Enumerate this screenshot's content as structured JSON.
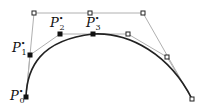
{
  "diagram": {
    "type": "bezier-subdivision",
    "colors": {
      "curve": "#222222",
      "polygon": "#b0b0b0",
      "point_fill": "#111111",
      "point_hollow_stroke": "#222222",
      "background": "#ffffff"
    },
    "outer_polygon": [
      [
        26,
        97
      ],
      [
        34,
        13
      ],
      [
        90,
        13
      ],
      [
        143,
        13
      ],
      [
        192,
        99
      ]
    ],
    "inner_polygon": [
      [
        26,
        97
      ],
      [
        30,
        55
      ],
      [
        60,
        34
      ],
      [
        93,
        34
      ],
      [
        128,
        34
      ],
      [
        167,
        57
      ],
      [
        192,
        99
      ]
    ],
    "hollow_points": [
      [
        34,
        13
      ],
      [
        90,
        13
      ],
      [
        143,
        13
      ],
      [
        128,
        34
      ],
      [
        167,
        57
      ],
      [
        192,
        99
      ]
    ],
    "filled_points": [
      [
        26,
        97
      ],
      [
        30,
        55
      ],
      [
        60,
        34
      ],
      [
        93,
        34
      ]
    ],
    "curve_path": "M26,97 C27,68 40,40 93,34 C130,32 170,55 192,99",
    "labels": [
      {
        "id": "p0",
        "base": "P",
        "sub": "0",
        "sup": "•",
        "x": 10,
        "y": 100
      },
      {
        "id": "p1",
        "base": "P",
        "sub": "1",
        "sup": "•",
        "x": 12,
        "y": 52
      },
      {
        "id": "p2",
        "base": "P",
        "sub": "2",
        "sup": "•",
        "x": 50,
        "y": 27
      },
      {
        "id": "p3",
        "base": "P",
        "sub": "3",
        "sup": "•",
        "x": 86,
        "y": 27
      }
    ]
  }
}
